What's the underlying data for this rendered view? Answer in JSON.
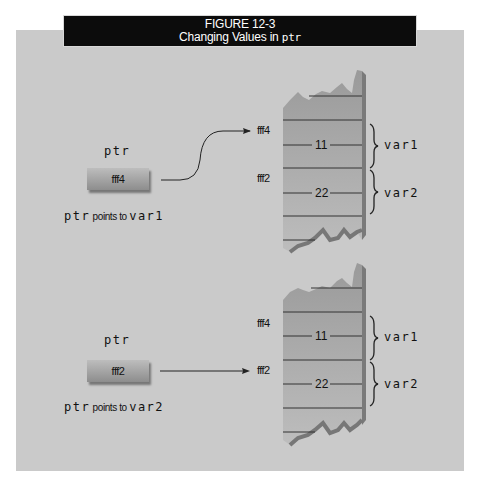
{
  "figure": {
    "number": "FIGURE 12-3",
    "title_prefix": "Changing Values in ",
    "title_code": "ptr"
  },
  "panels": [
    {
      "pointer_label": "ptr",
      "pointer_value": "fff4",
      "caption_code": "ptr",
      "caption_text": " points to ",
      "caption_target": "var1",
      "arrow_target": "fff4",
      "memory": {
        "addresses": [
          "fff4",
          "fff2"
        ],
        "cells": [
          {
            "value": "11",
            "var": "var1"
          },
          {
            "value": "22",
            "var": "var2"
          }
        ]
      }
    },
    {
      "pointer_label": "ptr",
      "pointer_value": "fff2",
      "caption_code": "ptr",
      "caption_text": " points to ",
      "caption_target": "var2",
      "arrow_target": "fff2",
      "memory": {
        "addresses": [
          "fff4",
          "fff2"
        ],
        "cells": [
          {
            "value": "11",
            "var": "var1"
          },
          {
            "value": "22",
            "var": "var2"
          }
        ]
      }
    }
  ],
  "colors": {
    "frame_bg": "#cacaca",
    "title_bg": "#0c0c0c",
    "stack_fill": "#a8a8a8",
    "stack_edge": "#7a7a7a"
  }
}
